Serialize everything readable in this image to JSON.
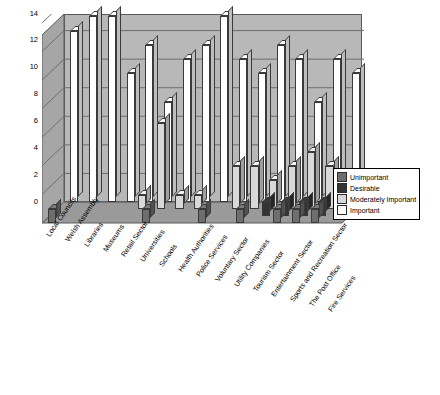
{
  "chart_data": {
    "type": "bar",
    "title": "",
    "xlabel": "",
    "ylabel": "",
    "ylim": [
      0,
      14
    ],
    "yticks": [
      0,
      2,
      4,
      6,
      8,
      10,
      12,
      14
    ],
    "grid": true,
    "legend_position": "right",
    "categories": [
      "Local Councils",
      "Welsh Assembly",
      "Libraries",
      "Museums",
      "Retail Sector",
      "Universities",
      "Schools",
      "Health Authorities",
      "Police Services",
      "Voluntary Sector",
      "Utility Companies",
      "Tourism Sector",
      "Entertainment Sector",
      "Sports and Recreation Sector",
      "The Post Office",
      "Fire Services"
    ],
    "series": [
      {
        "name": "Unimportant",
        "color": "#6e6e6e",
        "values": [
          1,
          0,
          0,
          0,
          0,
          1,
          0,
          0,
          1,
          0,
          1,
          0,
          1,
          1,
          1,
          0
        ]
      },
      {
        "name": "Desirable",
        "color": "#333333",
        "values": [
          0,
          0,
          0,
          0,
          0,
          0,
          0,
          0,
          0,
          0,
          0,
          1,
          1,
          1,
          1,
          0
        ]
      },
      {
        "name": "Moderately Important",
        "color": "#d8d8d8",
        "values": [
          0,
          0,
          0,
          0,
          1,
          6,
          1,
          1,
          0,
          3,
          3,
          2,
          3,
          4,
          3,
          1
        ]
      },
      {
        "name": "Important",
        "color": "#ffffff",
        "values": [
          12,
          13,
          13,
          9,
          11,
          7,
          10,
          11,
          13,
          10,
          9,
          11,
          10,
          7,
          10,
          9
        ]
      }
    ]
  },
  "legend": {
    "entries": [
      {
        "label": "Unimportant"
      },
      {
        "label": "Desirable"
      },
      {
        "label": "Moderately Important"
      },
      {
        "label": "Important"
      }
    ]
  },
  "colors": {
    "back_wall": "#b8b8b8",
    "floor": "#9a9a9a",
    "side_wall": "#a8a8a8",
    "axis": "#000000",
    "gridline": "#6e6e6e"
  }
}
